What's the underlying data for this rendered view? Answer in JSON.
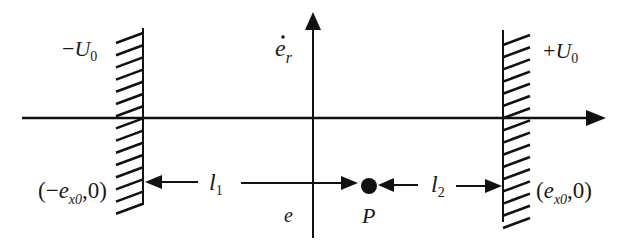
{
  "diagram": {
    "colors": {
      "stroke": "#111111",
      "text": "#1a1a1a",
      "background": "#ffffff"
    },
    "axes": {
      "horizontal": {
        "y": 118,
        "x_start": 22,
        "x_end": 606,
        "arrow": "right"
      },
      "vertical": {
        "x": 313,
        "y_start": 238,
        "y_end": 12,
        "arrow": "up",
        "label": "ė_r",
        "label_base": "e",
        "label_sub": "r"
      }
    },
    "walls": [
      {
        "id": "left-wall",
        "x": 143,
        "y_top": 28,
        "y_bottom": 205,
        "hatch_side": "left",
        "potential_label_sign": "−",
        "potential_label_base": "U",
        "potential_label_sub": "0",
        "point_label_open": "(−",
        "point_label_base": "e",
        "point_label_sub": "x0",
        "point_label_close": ",0)"
      },
      {
        "id": "right-wall",
        "x": 503,
        "y_top": 30,
        "y_bottom": 222,
        "hatch_side": "right",
        "potential_label_sign": "+",
        "potential_label_base": "U",
        "potential_label_sub": "0",
        "point_label_open": "(",
        "point_label_base": "e",
        "point_label_sub": "x0",
        "point_label_close": ",0)"
      }
    ],
    "dimension_line": {
      "y": 183,
      "l1": {
        "label_base": "l",
        "label_sub": "1"
      },
      "l2": {
        "label_base": "l",
        "label_sub": "2"
      }
    },
    "point": {
      "label": "P",
      "x": 369,
      "y": 186
    },
    "axis_label_lower": "e"
  }
}
